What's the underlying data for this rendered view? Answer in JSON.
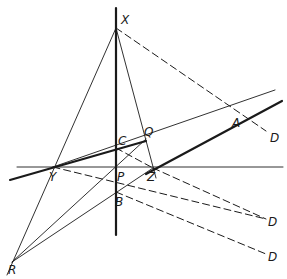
{
  "diagram": {
    "type": "projective-geometry-construction",
    "stroke_color": "#1a1a1a",
    "background": "#ffffff",
    "points": [
      {
        "id": "X",
        "label": "X",
        "x": 116,
        "y": 28,
        "lx": 121,
        "ly": 24
      },
      {
        "id": "C",
        "label": "C",
        "x": 116,
        "y": 148,
        "lx": 118,
        "ly": 145
      },
      {
        "id": "Q",
        "label": "Q",
        "x": 146,
        "y": 139,
        "lx": 144,
        "ly": 136
      },
      {
        "id": "A",
        "label": "A",
        "x": 238,
        "y": 112,
        "lx": 232,
        "ly": 127
      },
      {
        "id": "D1",
        "label": "D",
        "x": 268,
        "y": 133,
        "lx": 270,
        "ly": 142
      },
      {
        "id": "Y",
        "label": "Y",
        "x": 53,
        "y": 167,
        "lx": 49,
        "ly": 181
      },
      {
        "id": "P",
        "label": "P",
        "x": 116,
        "y": 167,
        "lx": 117,
        "ly": 181
      },
      {
        "id": "Z",
        "label": "Z",
        "x": 153,
        "y": 168,
        "lx": 147,
        "ly": 181
      },
      {
        "id": "B",
        "label": "B",
        "x": 116,
        "y": 192,
        "lx": 115,
        "ly": 206
      },
      {
        "id": "D2",
        "label": "D",
        "x": 268,
        "y": 220,
        "lx": 268,
        "ly": 226
      },
      {
        "id": "D3",
        "label": "D",
        "x": 268,
        "y": 255,
        "lx": 268,
        "ly": 261
      },
      {
        "id": "R",
        "label": "R",
        "x": 12,
        "y": 262,
        "lx": 8,
        "ly": 274
      }
    ],
    "lines": [
      {
        "name": "vertical-axis",
        "style": "thick",
        "x1": 116,
        "y1": 8,
        "x2": 116,
        "y2": 235
      },
      {
        "name": "horizontal-axis",
        "style": "thin",
        "x1": 17,
        "y1": 167,
        "x2": 283,
        "y2": 167
      },
      {
        "name": "thick-line-through-Y-C",
        "style": "thick",
        "x1": 10,
        "y1": 180,
        "x2": 146,
        "y2": 141
      },
      {
        "name": "thick-line-Z-A",
        "style": "thick",
        "x1": 146,
        "y1": 174,
        "x2": 282,
        "y2": 101
      },
      {
        "name": "line-Y-Q-A",
        "style": "thin",
        "x1": 53,
        "y1": 167,
        "x2": 275,
        "y2": 90
      },
      {
        "name": "line-R-X",
        "style": "thin",
        "x1": 7,
        "y1": 275,
        "x2": 116,
        "y2": 28
      },
      {
        "name": "line-X-Z",
        "style": "thin",
        "x1": 116,
        "y1": 28,
        "x2": 156,
        "y2": 178
      },
      {
        "name": "line-R-Q",
        "style": "thin",
        "x1": 12,
        "y1": 262,
        "x2": 146,
        "y2": 139
      },
      {
        "name": "line-R-Z",
        "style": "thin",
        "x1": 12,
        "y1": 262,
        "x2": 153,
        "y2": 168
      },
      {
        "name": "dashed-X-A-D",
        "style": "dashed",
        "x1": 116,
        "y1": 28,
        "x2": 266,
        "y2": 131
      },
      {
        "name": "dashed-C-Z",
        "style": "dashed",
        "x1": 116,
        "y1": 148,
        "x2": 153,
        "y2": 168
      },
      {
        "name": "dashed-Z-D",
        "style": "dashed",
        "x1": 153,
        "y1": 168,
        "x2": 266,
        "y2": 219
      },
      {
        "name": "dashed-Y-B-D",
        "style": "dashed",
        "x1": 53,
        "y1": 167,
        "x2": 266,
        "y2": 219
      },
      {
        "name": "dashed-B-D",
        "style": "dashed",
        "x1": 116,
        "y1": 192,
        "x2": 266,
        "y2": 254
      }
    ]
  }
}
